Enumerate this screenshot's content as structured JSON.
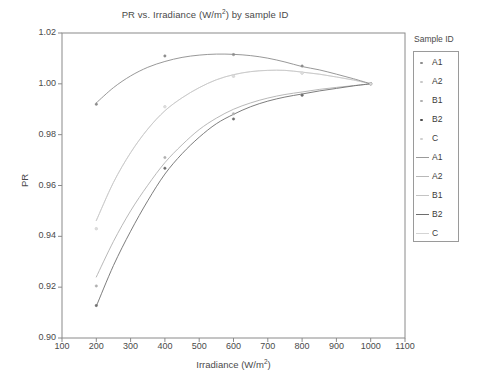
{
  "chart_data": {
    "type": "scatter",
    "title": "PR vs. Irradiance (W/m2) by sample ID",
    "title_main": "PR vs. Irradiance (W/m",
    "title_sup": "2",
    "title_tail": ") by sample ID",
    "xlabel": "Irradiance (W/m2)",
    "xlabel_main": "Irradiance (W/m",
    "xlabel_sup": "2",
    "xlabel_tail": ")",
    "ylabel": "PR",
    "xlim": [
      100,
      1100
    ],
    "ylim": [
      0.9,
      1.02
    ],
    "grid": false,
    "xticks": [
      100,
      200,
      300,
      400,
      500,
      600,
      700,
      800,
      900,
      1000,
      1100
    ],
    "xtick_labels": [
      "100",
      "200",
      "300",
      "400",
      "500",
      "600",
      "700",
      "800",
      "900",
      "1000",
      "1100"
    ],
    "yticks": [
      0.9,
      0.92,
      0.94,
      0.96,
      0.98,
      1.0,
      1.02
    ],
    "ytick_labels": [
      "0.90",
      "0.92",
      "0.94",
      "0.96",
      "0.98",
      "1.00",
      "1.02"
    ],
    "legend_title": "Sample ID",
    "legend_position": "right outside",
    "x": [
      200,
      400,
      600,
      800,
      1000
    ],
    "series": [
      {
        "name": "A1",
        "color": "#8c8c8c",
        "marker": "point",
        "values": [
          0.992,
          1.011,
          1.0115,
          1.007,
          1.0
        ],
        "fit": [
          [
            200,
            0.9925
          ],
          [
            250,
            0.9985
          ],
          [
            300,
            1.0031
          ],
          [
            350,
            1.0065
          ],
          [
            400,
            1.0088
          ],
          [
            450,
            1.0104
          ],
          [
            500,
            1.0113
          ],
          [
            550,
            1.0117
          ],
          [
            600,
            1.0116
          ],
          [
            650,
            1.0111
          ],
          [
            700,
            1.0101
          ],
          [
            750,
            1.0086
          ],
          [
            800,
            1.0068
          ],
          [
            850,
            1.0055
          ],
          [
            900,
            1.0038
          ],
          [
            950,
            1.002
          ],
          [
            1000,
            1.0
          ]
        ]
      },
      {
        "name": "A2",
        "color": "#c8c8c8",
        "marker": "point",
        "values": [
          0.943,
          0.991,
          1.003,
          1.0042,
          1.0
        ],
        "fit": [
          [
            200,
            0.9462
          ],
          [
            250,
            0.9612
          ],
          [
            300,
            0.9729
          ],
          [
            350,
            0.9822
          ],
          [
            400,
            0.9894
          ],
          [
            450,
            0.9945
          ],
          [
            500,
            0.9985
          ],
          [
            550,
            1.0016
          ],
          [
            600,
            1.0036
          ],
          [
            650,
            1.0048
          ],
          [
            700,
            1.0053
          ],
          [
            750,
            1.0053
          ],
          [
            800,
            1.0046
          ],
          [
            850,
            1.0038
          ],
          [
            900,
            1.0027
          ],
          [
            950,
            1.0015
          ],
          [
            1000,
            1.0
          ]
        ]
      },
      {
        "name": "B1",
        "color": "#b0b0b0",
        "marker": "point",
        "values": [
          0.9205,
          0.971,
          0.9882,
          0.9958,
          1.0
        ],
        "fit": [
          [
            200,
            0.924
          ],
          [
            250,
            0.938
          ],
          [
            300,
            0.95
          ],
          [
            350,
            0.9601
          ],
          [
            400,
            0.969
          ],
          [
            450,
            0.976
          ],
          [
            500,
            0.982
          ],
          [
            550,
            0.9865
          ],
          [
            600,
            0.99
          ],
          [
            650,
            0.9925
          ],
          [
            700,
            0.9944
          ],
          [
            750,
            0.9958
          ],
          [
            800,
            0.9968
          ],
          [
            850,
            0.9978
          ],
          [
            900,
            0.9986
          ],
          [
            950,
            0.9993
          ],
          [
            1000,
            1.0
          ]
        ]
      },
      {
        "name": "B2",
        "color": "#6e6e6e",
        "marker": "point",
        "values": [
          0.9128,
          0.9668,
          0.9862,
          0.9955,
          1.0
        ],
        "fit": [
          [
            200,
            0.9125
          ],
          [
            250,
            0.9285
          ],
          [
            300,
            0.942
          ],
          [
            350,
            0.954
          ],
          [
            400,
            0.9645
          ],
          [
            450,
            0.9725
          ],
          [
            500,
            0.979
          ],
          [
            550,
            0.9843
          ],
          [
            600,
            0.988
          ],
          [
            650,
            0.991
          ],
          [
            700,
            0.9932
          ],
          [
            750,
            0.9948
          ],
          [
            800,
            0.996
          ],
          [
            850,
            0.9972
          ],
          [
            900,
            0.9982
          ],
          [
            950,
            0.9992
          ],
          [
            1000,
            1.0
          ]
        ]
      },
      {
        "name": "C",
        "color": "#dcdcdc",
        "marker": "point",
        "values": [
          0.943,
          0.991,
          1.003,
          1.0042,
          1.0
        ],
        "fit": [
          [
            200,
            0.9462
          ],
          [
            250,
            0.9612
          ],
          [
            300,
            0.9729
          ],
          [
            350,
            0.9822
          ],
          [
            400,
            0.9894
          ],
          [
            450,
            0.9945
          ],
          [
            500,
            0.9985
          ],
          [
            550,
            1.0016
          ],
          [
            600,
            1.0036
          ],
          [
            650,
            1.0048
          ],
          [
            700,
            1.0053
          ],
          [
            750,
            1.0053
          ],
          [
            800,
            1.0046
          ],
          [
            850,
            1.0038
          ],
          [
            900,
            1.0027
          ],
          [
            950,
            1.0015
          ],
          [
            1000,
            1.0
          ]
        ]
      }
    ],
    "legend_marker_entries": [
      {
        "label": "A1",
        "color": "#8c8c8c"
      },
      {
        "label": "A2",
        "color": "#c8c8c8"
      },
      {
        "label": "B1",
        "color": "#b0b0b0"
      },
      {
        "label": "B2",
        "color": "#4a4a4a"
      },
      {
        "label": "C",
        "color": "#cfcfcf"
      }
    ],
    "legend_line_entries": [
      {
        "label": "A1",
        "color": "#9a9a9a"
      },
      {
        "label": "A2",
        "color": "#b8b8b8"
      },
      {
        "label": "B1",
        "color": "#c4c4c4"
      },
      {
        "label": "B2",
        "color": "#6e6e6e"
      },
      {
        "label": "C",
        "color": "#d4d4d4"
      }
    ],
    "axis_color": "#8a8a8a",
    "frame": {
      "left": 62,
      "right": 405,
      "top": 33,
      "bottom": 338
    }
  }
}
